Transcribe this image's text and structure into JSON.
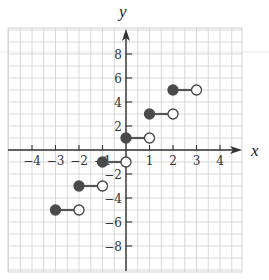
{
  "chart_data": {
    "type": "line",
    "subtype": "step-function",
    "title": "",
    "xlabel": "x",
    "ylabel": "y",
    "xlim": [
      -5,
      5
    ],
    "ylim": [
      -10,
      10
    ],
    "x_ticks": [
      -4,
      -3,
      -2,
      -1,
      1,
      2,
      3,
      4
    ],
    "x_tick_labels": [
      "-4",
      "-3",
      "-2",
      "-1",
      "1",
      "2",
      "3",
      "4"
    ],
    "y_ticks": [
      8,
      6,
      4,
      2,
      -2,
      -4,
      -6,
      -8
    ],
    "y_tick_labels": [
      "8",
      "6",
      "4",
      "2",
      "-2",
      "-4",
      "-6",
      "-8"
    ],
    "grid": true,
    "series": [
      {
        "name": "step segments",
        "segments": [
          {
            "x_start": -3,
            "x_end": -2,
            "y": -5,
            "start_closed": true,
            "end_closed": false
          },
          {
            "x_start": -2,
            "x_end": -1,
            "y": -3,
            "start_closed": true,
            "end_closed": false
          },
          {
            "x_start": -1,
            "x_end": 0,
            "y": -1,
            "start_closed": true,
            "end_closed": false
          },
          {
            "x_start": 0,
            "x_end": 1,
            "y": 1,
            "start_closed": true,
            "end_closed": false
          },
          {
            "x_start": 1,
            "x_end": 2,
            "y": 3,
            "start_closed": true,
            "end_closed": false
          },
          {
            "x_start": 2,
            "x_end": 3,
            "y": 5,
            "start_closed": true,
            "end_closed": false
          }
        ]
      }
    ],
    "colors": {
      "grid": "#d4d4d4",
      "axis": "#333333",
      "closed_dot": "#4a4a4a",
      "open_dot_stroke": "#444444",
      "segment": "#555555"
    }
  },
  "labels": {
    "x_axis": "x",
    "y_axis": "y"
  }
}
